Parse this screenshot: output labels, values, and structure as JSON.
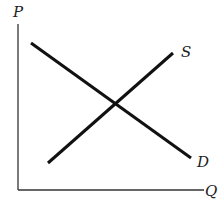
{
  "diagram": {
    "type": "supply-demand",
    "axes": {
      "y_label": "P",
      "x_label": "Q"
    },
    "curves": [
      {
        "name": "supply",
        "label": "S",
        "from": [
          48,
          163
        ],
        "to": [
          173,
          53
        ]
      },
      {
        "name": "demand",
        "label": "D",
        "from": [
          31,
          43
        ],
        "to": [
          191,
          158
        ]
      }
    ],
    "colors": {
      "line": "#111111",
      "axis": "#333333",
      "background": "#ffffff"
    }
  }
}
